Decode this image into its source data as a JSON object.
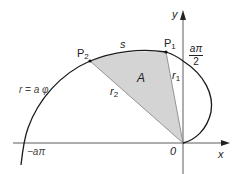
{
  "diagram": {
    "type": "archimedean-spiral-sector",
    "colors": {
      "curve": "#1a1a1a",
      "axis": "#333333",
      "fill": "#d4d4d4",
      "radius": "#8a8a8a",
      "text": "#222222"
    },
    "axes": {
      "x_label": "x",
      "y_label": "y",
      "origin_label": "0"
    },
    "curve_label": "r = a φ",
    "points": [
      {
        "name": "P",
        "sub": "1",
        "label": "P1"
      },
      {
        "name": "P",
        "sub": "2",
        "label": "P2"
      }
    ],
    "radii": [
      {
        "name": "r",
        "sub": "1"
      },
      {
        "name": "r",
        "sub": "2"
      }
    ],
    "arc_label": "s",
    "area_label": "A",
    "y_intercept": {
      "numerator": "aπ",
      "denominator": "2"
    },
    "x_intercept": "−aπ"
  }
}
